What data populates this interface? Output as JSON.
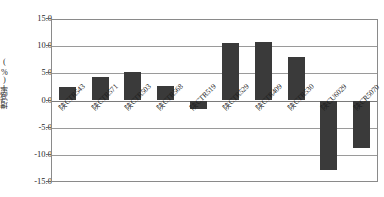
{
  "chart_data": {
    "type": "bar",
    "title": "",
    "xlabel": "",
    "ylabel": "增减率(%)",
    "ylim": [
      -15.0,
      15.0
    ],
    "yticks": [
      "15.0",
      "10.0",
      "5.0",
      "0.0",
      "-5.0",
      "-10.0",
      "-15.0"
    ],
    "ytick_values": [
      15.0,
      10.0,
      5.0,
      0.0,
      -5.0,
      -10.0,
      -15.0
    ],
    "grid": true,
    "legend": "none",
    "bar_color": "#3a3a3a",
    "categories": [
      "陕CTR543",
      "陕CTR571",
      "陕CTR503",
      "陕CTR568",
      "陕CTR519",
      "陕CTR529",
      "陕CTR409",
      "陕CTR530",
      "陕CU6029",
      "陕CR5070"
    ],
    "values": [
      2.5,
      4.4,
      5.2,
      2.7,
      -1.6,
      10.5,
      10.8,
      8.0,
      -12.8,
      -8.7
    ]
  }
}
